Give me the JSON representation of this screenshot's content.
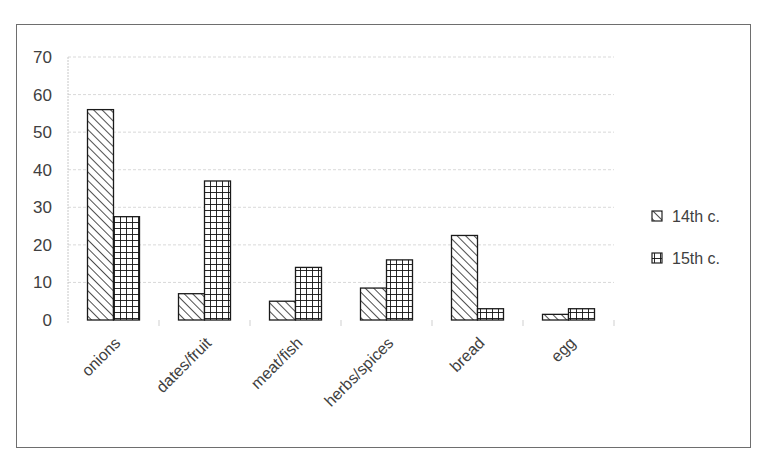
{
  "chart_data": {
    "type": "bar",
    "title": "",
    "xlabel": "",
    "ylabel": "",
    "categories": [
      "onions",
      "dates/fruit",
      "meat/fish",
      "herbs/spices",
      "bread",
      "egg"
    ],
    "series": [
      {
        "name": "14th c.",
        "pattern": "diagonal-hatch",
        "values": [
          56,
          7,
          5,
          8.5,
          22.5,
          1.5
        ]
      },
      {
        "name": "15th c.",
        "pattern": "cross-hatch",
        "values": [
          27.5,
          37,
          14,
          16,
          3,
          3
        ]
      }
    ],
    "ylim": [
      0,
      70
    ],
    "yticks": [
      "0",
      "10",
      "20",
      "30",
      "40",
      "50",
      "60",
      "70"
    ],
    "grid": true,
    "legend_position": "right",
    "colors": {
      "bar_stroke": "#1a1a1a",
      "bar_fill": "#ffffff",
      "gridline": "#d9d9d9",
      "frame": "#6e6e6e"
    }
  },
  "legend": {
    "items": [
      {
        "label": "14th c."
      },
      {
        "label": "15th c."
      }
    ]
  }
}
